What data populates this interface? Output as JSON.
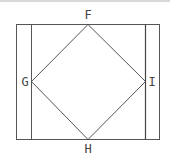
{
  "diagram": {
    "type": "geometry-figure",
    "labels": {
      "top": "F",
      "left": "G",
      "right": "I",
      "bottom": "H"
    },
    "points": {
      "F": [
        88,
        24
      ],
      "G": [
        31,
        81
      ],
      "H": [
        88,
        139
      ],
      "I": [
        145,
        81
      ]
    },
    "outer_rectangle": {
      "x1": 16,
      "y1": 24,
      "x2": 160,
      "y2": 139
    },
    "inner_vertical_lines": [
      31,
      145
    ],
    "colors": {
      "line": "#555555",
      "label": "#444444",
      "background": "#ffffff",
      "top_bar": "#d8d8d8"
    }
  }
}
